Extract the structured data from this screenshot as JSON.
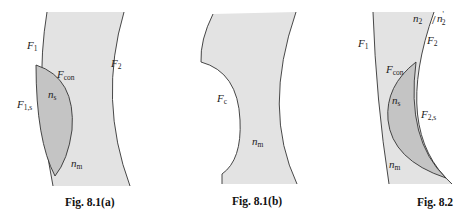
{
  "figures": [
    {
      "caption": "Fig. 8.1(a)",
      "labels": {
        "F1": {
          "main": "F",
          "sub": "1"
        },
        "F2": {
          "main": "F",
          "sub": "2"
        },
        "Fcon": {
          "main": "F",
          "sub": "con"
        },
        "F1s": {
          "main": "F",
          "sub": "1,s"
        },
        "ns": {
          "main": "n",
          "sub": "s"
        },
        "nm": {
          "main": "n",
          "sub": "m"
        }
      }
    },
    {
      "caption": "Fig. 8.1(b)",
      "labels": {
        "Fc": {
          "main": "F",
          "sub": "c"
        },
        "nm": {
          "main": "n",
          "sub": "m"
        }
      }
    },
    {
      "caption": "Fig. 8.2",
      "labels": {
        "F1": {
          "main": "F",
          "sub": "1"
        },
        "F2": {
          "main": "F",
          "sub": "2"
        },
        "n2": {
          "main": "n",
          "sub": "2"
        },
        "n2p": {
          "main": "n",
          "sub": "2",
          "sup": "'"
        },
        "Fcon": {
          "main": "F",
          "sub": "con"
        },
        "ns": {
          "main": "n",
          "sub": "s"
        },
        "F2s": {
          "main": "F",
          "sub": "2,s"
        },
        "nm": {
          "main": "n",
          "sub": "m"
        }
      }
    }
  ],
  "colors": {
    "matrix_fill": "#e3e3e3",
    "inset_fill": "#c4c4c4",
    "stroke": "#333333"
  }
}
